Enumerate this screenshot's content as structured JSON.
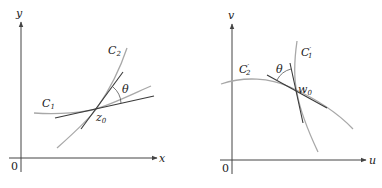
{
  "colors": {
    "axis": "#444444",
    "curve": "#a8a8a8",
    "tangent": "#3a3a3a",
    "text": "#222222",
    "background": "#ffffff"
  },
  "left_panel": {
    "axes": {
      "x_label": "x",
      "y_label": "y",
      "origin_label": "0"
    },
    "curve_1": {
      "label": "C",
      "subscript": "1"
    },
    "curve_2": {
      "label": "C",
      "subscript": "2"
    },
    "point": {
      "label": "z",
      "subscript": "0"
    },
    "angle": {
      "label": "θ"
    }
  },
  "right_panel": {
    "axes": {
      "x_label": "u",
      "y_label": "v",
      "origin_label": "0"
    },
    "curve_1": {
      "label": "C",
      "subscript": "1",
      "prime": "′"
    },
    "curve_2": {
      "label": "C",
      "subscript": "2",
      "prime": "′"
    },
    "point": {
      "label": "w",
      "subscript": "0"
    },
    "angle": {
      "label": "θ"
    }
  }
}
